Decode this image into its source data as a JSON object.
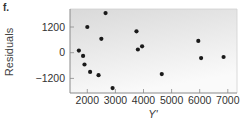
{
  "panel": {
    "label": "f."
  },
  "chart_data": {
    "type": "scatter",
    "title": "",
    "xlabel": "Y'",
    "ylabel": "Residuals",
    "xlim": [
      1400,
      7100
    ],
    "ylim": [
      -1850,
      2050
    ],
    "xticks": [
      2000,
      3000,
      4000,
      5000,
      6000,
      7000
    ],
    "yticks": [
      -1200,
      0,
      1200
    ],
    "grid": false,
    "legend": null,
    "points": [
      {
        "x": 1700,
        "y": 100
      },
      {
        "x": 1850,
        "y": -150
      },
      {
        "x": 1900,
        "y": -550
      },
      {
        "x": 2000,
        "y": 1200
      },
      {
        "x": 2100,
        "y": -900
      },
      {
        "x": 2400,
        "y": -1050
      },
      {
        "x": 2500,
        "y": 650
      },
      {
        "x": 2650,
        "y": 1850
      },
      {
        "x": 2900,
        "y": -1650
      },
      {
        "x": 3750,
        "y": 1000
      },
      {
        "x": 3800,
        "y": 150
      },
      {
        "x": 3950,
        "y": 300
      },
      {
        "x": 4650,
        "y": -1000
      },
      {
        "x": 5950,
        "y": 550
      },
      {
        "x": 6050,
        "y": -250
      },
      {
        "x": 6850,
        "y": -200
      }
    ]
  },
  "colors": {
    "point": "#1a1a1a",
    "frame": "#8a8a8a",
    "bg_top": "#d9d9d9",
    "bg_bottom": "#fafafa"
  }
}
